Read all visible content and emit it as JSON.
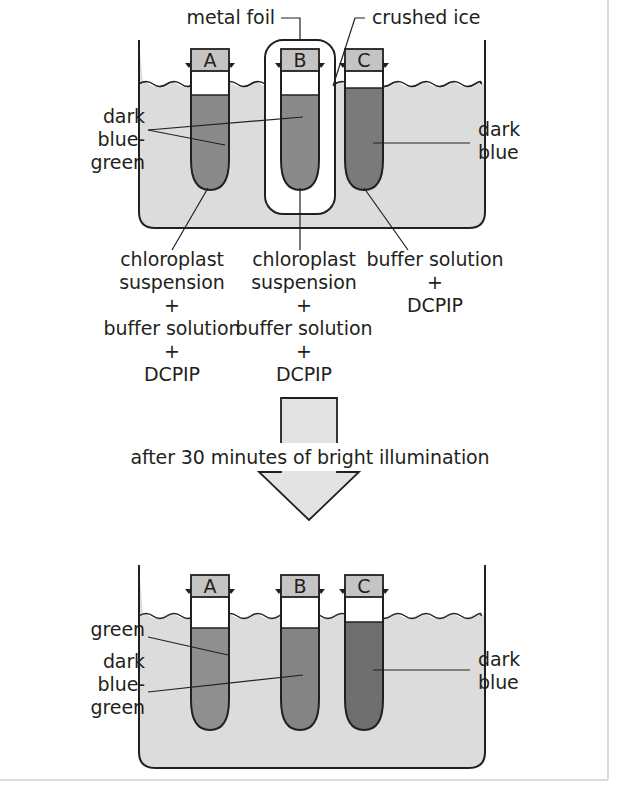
{
  "figure": {
    "type": "scientific-diagram"
  },
  "top_panel": {
    "annotations": {
      "metal_foil": "metal foil",
      "crushed_ice": "crushed ice",
      "left_color_line1": "dark",
      "left_color_line2": "blue-",
      "left_color_line3": "green",
      "right_color_line1": "dark",
      "right_color_line2": "blue"
    },
    "tubes": [
      {
        "id": "tube-a",
        "label": "A",
        "wrapped_in_foil": false,
        "liquid_color": "#8a8a8a",
        "contents_lines": [
          "chloroplast",
          "suspension",
          "+",
          "buffer solution",
          "+",
          "DCPIP"
        ]
      },
      {
        "id": "tube-b",
        "label": "B",
        "wrapped_in_foil": true,
        "liquid_color": "#8a8a8a",
        "contents_lines": [
          "chloroplast",
          "suspension",
          "+",
          "buffer solution",
          "+",
          "DCPIP"
        ]
      },
      {
        "id": "tube-c",
        "label": "C",
        "wrapped_in_foil": false,
        "liquid_color": "#7a7a7a",
        "contents_lines": [
          "buffer solution",
          "+",
          "DCPIP"
        ]
      }
    ]
  },
  "process_arrow": {
    "caption": "after 30 minutes of bright illumination"
  },
  "bottom_panel": {
    "annotations": {
      "left_color_a": "green",
      "left_color_b_line1": "dark",
      "left_color_b_line2": "blue-",
      "left_color_b_line3": "green",
      "right_color_line1": "dark",
      "right_color_line2": "blue"
    },
    "tubes": [
      {
        "id": "tube-a-after",
        "label": "A",
        "liquid_color": "#8f8f8f"
      },
      {
        "id": "tube-b-after",
        "label": "B",
        "liquid_color": "#848484"
      },
      {
        "id": "tube-c-after",
        "label": "C",
        "liquid_color": "#6f6f6f"
      }
    ]
  },
  "colors": {
    "ink": "#231f20",
    "beaker_water": "#dcdcdc",
    "tube_cap": "#c4c4c4",
    "tube_air": "#ffffff",
    "arrow_fill": "#e3e3e3",
    "frame": "#dcdcdc"
  }
}
